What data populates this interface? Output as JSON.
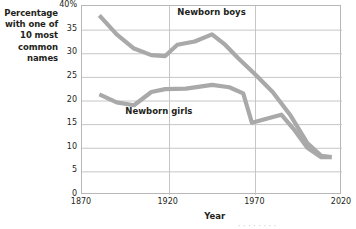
{
  "chart_data": {
    "type": "line",
    "title": "",
    "xlabel": "Year",
    "ylabel": "Percentage with one of 10 most common names",
    "ylabel_lines": [
      "Percentage",
      "with one of",
      "10 most",
      "common",
      "names"
    ],
    "xlim": [
      1870,
      2020
    ],
    "ylim": [
      0,
      40
    ],
    "grid": true,
    "grid_axes": "both",
    "legend_position": "inline-annotations",
    "xticks": [
      1870,
      1920,
      1970,
      2020
    ],
    "xticklabels": [
      "1870",
      "1920",
      "1970",
      "2020"
    ],
    "yticks": [
      0,
      5,
      10,
      15,
      20,
      25,
      30,
      35,
      40
    ],
    "yticklabels": [
      "0",
      "5",
      "10",
      "15",
      "20",
      "25",
      "30",
      "35",
      "40%"
    ],
    "series": [
      {
        "name": "Newborn boys",
        "color": "#a9a9a9",
        "label_x": 1925,
        "label_y": 38.5,
        "x": [
          1880,
          1890,
          1900,
          1910,
          1918,
          1925,
          1935,
          1945,
          1952,
          1960,
          1970,
          1980,
          1990,
          2000,
          2008,
          2014
        ],
        "values": [
          38.0,
          34.0,
          31.0,
          29.6,
          29.4,
          31.8,
          32.5,
          34.0,
          32.0,
          29.0,
          25.5,
          21.8,
          17.0,
          11.0,
          8.3,
          8.0
        ]
      },
      {
        "name": "Newborn girls",
        "color": "#a9a9a9",
        "label_x": 1895,
        "label_y": 17.5,
        "x": [
          1880,
          1890,
          1900,
          1910,
          1918,
          1930,
          1945,
          1955,
          1963,
          1968,
          1977,
          1985,
          1992,
          2000,
          2008,
          2014
        ],
        "values": [
          21.3,
          19.6,
          19.0,
          21.8,
          22.4,
          22.5,
          23.3,
          22.8,
          21.5,
          15.3,
          16.2,
          17.0,
          14.0,
          10.0,
          8.0,
          8.0
        ]
      }
    ]
  },
  "axis_caption": {
    "x": "Year"
  },
  "bottom_crop_text": "· · · · · · · ·"
}
